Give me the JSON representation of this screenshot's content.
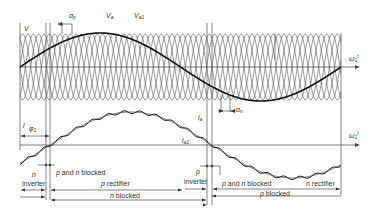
{
  "figure": {
    "top_panel": {
      "labels": {
        "v": "V",
        "v_a": "V",
        "v_a_sub": "a",
        "v_a1": "V",
        "v_a1_sub": "a1",
        "alpha_p": "α",
        "alpha_p_sub": "p",
        "alpha_n": "α",
        "alpha_n_sub": "n",
        "axis": "ω",
        "axis_sub": "1",
        "axis_t": "t"
      }
    },
    "bottom_panel": {
      "labels": {
        "i": "i",
        "phi": "φ",
        "phi_sub": "1",
        "i_a": "i",
        "i_a_sub": "a",
        "i_a1": "i",
        "i_a1_sub": "a1",
        "axis": "ω",
        "axis_sub": "1",
        "axis_t": "t"
      },
      "modes": {
        "n_inverter_top": "n",
        "n_inverter_bottom": "inverter",
        "pn_blocked_1": "p and n blocked",
        "p_rectifier": "p rectifier",
        "n_blocked": "n blocked",
        "p_inverter_top": "p",
        "p_inverter_bottom": "inverter",
        "pn_blocked_2": "p and n blocked",
        "n_rectifier": "n rectifier",
        "p_blocked": "p blocked"
      }
    }
  }
}
